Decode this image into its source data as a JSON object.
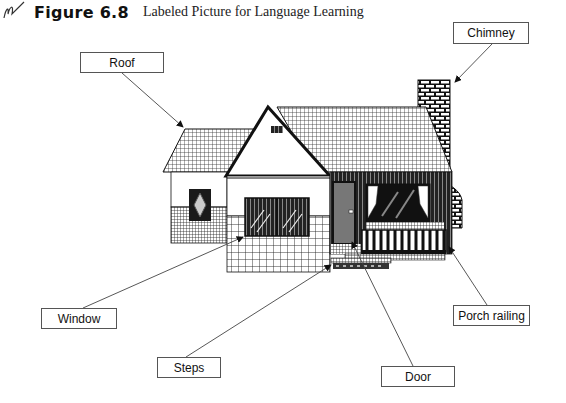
{
  "figure": {
    "number": "Figure 6.8",
    "title": "Labeled Picture for Language Learning",
    "logo_icon": "pen-scribble-icon"
  },
  "labels": [
    {
      "id": "roof",
      "text": "Roof"
    },
    {
      "id": "chimney",
      "text": "Chimney"
    },
    {
      "id": "window",
      "text": "Window"
    },
    {
      "id": "steps",
      "text": "Steps"
    },
    {
      "id": "door",
      "text": "Door"
    },
    {
      "id": "porch-railing",
      "text": "Porch railing"
    }
  ],
  "illustration": {
    "subject": "house",
    "colors": {
      "line": "#111111",
      "background": "#ffffff",
      "fill_dark": "#222222",
      "fill_mid": "#777777"
    }
  }
}
